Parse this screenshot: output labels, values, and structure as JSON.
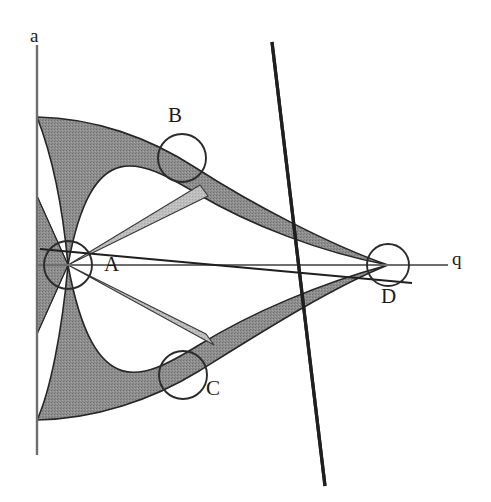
{
  "figure": {
    "background_color": "#ffffff",
    "axes": {
      "vertical": {
        "label": "a",
        "name": "a-axis",
        "color": "#6e6e6e",
        "x": 37,
        "y_top": 45,
        "y_bottom": 455
      },
      "horizontal": {
        "label": "q",
        "name": "q-axis",
        "color": "#6e6e6e",
        "y": 265,
        "x_left": 37,
        "x_right": 448
      }
    },
    "points": [
      {
        "id": "A",
        "label": "A",
        "cx": 68,
        "cy": 265,
        "r": 24
      },
      {
        "id": "B",
        "label": "B",
        "cx": 182,
        "cy": 158,
        "r": 24
      },
      {
        "id": "C",
        "label": "C",
        "cx": 183,
        "cy": 375,
        "r": 24
      },
      {
        "id": "D",
        "label": "D",
        "cx": 388,
        "cy": 265,
        "r": 21
      }
    ],
    "colors": {
      "shading_dark": "#8c8c8c",
      "shading_light": "#b8b8b8",
      "curve_stroke": "#262626",
      "line_stroke": "#1f1f1f",
      "axis_stroke": "#6e6e6e",
      "circle_stroke": "#2b2b2b",
      "text": "#1a1a1a"
    },
    "lines": [
      {
        "id": "steep-line",
        "name": "steep-diagonal-line",
        "x1": 272,
        "y1": 42,
        "x2": 325,
        "y2": 486,
        "width": 3.2
      },
      {
        "id": "shallow-line",
        "name": "shallow-diagonal-line",
        "x1": 40,
        "y1": 249,
        "x2": 412,
        "y2": 283,
        "width": 2.2
      }
    ],
    "regions": [
      {
        "id": "upper-lobe",
        "name": "upper-shaded-lobe",
        "fill": "#8c8c8c",
        "description": "Upper tongue bounded above by a descending arc from the a-axis and below by an ascending arc, converging to D."
      },
      {
        "id": "lower-lobe",
        "name": "lower-shaded-lobe",
        "fill": "#8c8c8c",
        "description": "Lower tongue mirroring the upper one below the q-axis, converging to D."
      },
      {
        "id": "origin-wedge",
        "name": "origin-light-wedge",
        "fill": "#b8b8b8",
        "description": "Light grey narrow wedge emanating from the vertex near A."
      }
    ]
  }
}
